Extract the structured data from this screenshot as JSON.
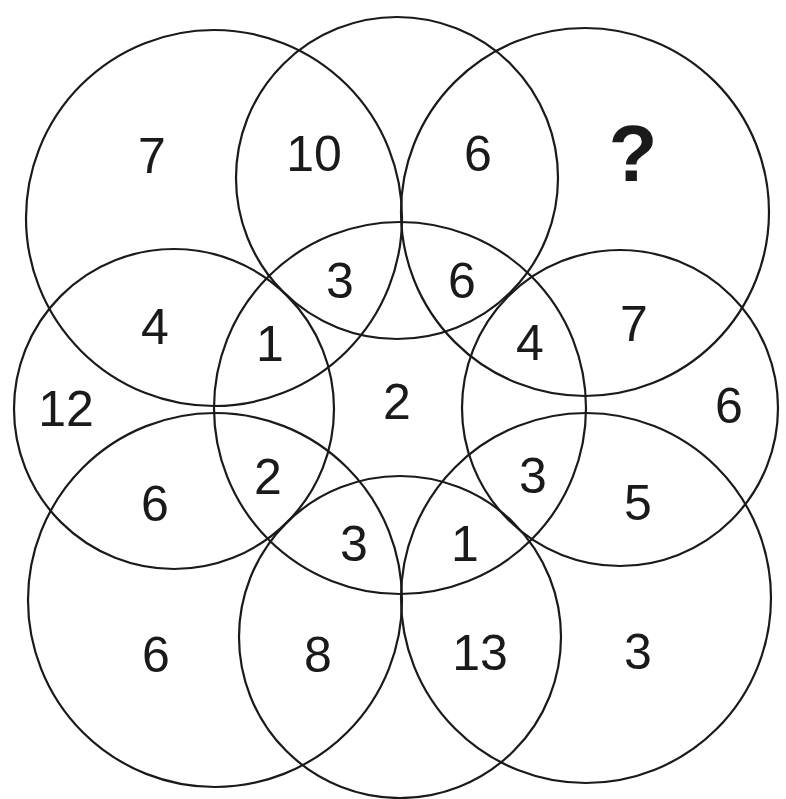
{
  "puzzle": {
    "circles": [
      {
        "id": "top-left",
        "cx": 214,
        "cy": 218,
        "r": 188
      },
      {
        "id": "top-middle",
        "cx": 397,
        "cy": 178,
        "r": 161
      },
      {
        "id": "top-right",
        "cx": 585,
        "cy": 212,
        "r": 184
      },
      {
        "id": "middle-left",
        "cx": 174,
        "cy": 409,
        "r": 160
      },
      {
        "id": "center",
        "cx": 400,
        "cy": 408,
        "r": 186
      },
      {
        "id": "middle-right",
        "cx": 620,
        "cy": 408,
        "r": 158
      },
      {
        "id": "bottom-left",
        "cx": 215,
        "cy": 600,
        "r": 187
      },
      {
        "id": "bottom-middle",
        "cx": 400,
        "cy": 637,
        "r": 161
      },
      {
        "id": "bottom-right",
        "cx": 586,
        "cy": 598,
        "r": 185
      }
    ],
    "labels": [
      {
        "text": "7",
        "x": 152,
        "y": 156
      },
      {
        "text": "10",
        "x": 314,
        "y": 154
      },
      {
        "text": "6",
        "x": 478,
        "y": 154
      },
      {
        "text": "?",
        "x": 633,
        "y": 153,
        "question": true
      },
      {
        "text": "3",
        "x": 340,
        "y": 281
      },
      {
        "text": "6",
        "x": 462,
        "y": 281
      },
      {
        "text": "4",
        "x": 155,
        "y": 327
      },
      {
        "text": "1",
        "x": 270,
        "y": 344
      },
      {
        "text": "4",
        "x": 530,
        "y": 343
      },
      {
        "text": "7",
        "x": 634,
        "y": 324
      },
      {
        "text": "12",
        "x": 66,
        "y": 409
      },
      {
        "text": "2",
        "x": 397,
        "y": 402
      },
      {
        "text": "6",
        "x": 729,
        "y": 406
      },
      {
        "text": "2",
        "x": 268,
        "y": 477
      },
      {
        "text": "3",
        "x": 533,
        "y": 476
      },
      {
        "text": "6",
        "x": 155,
        "y": 504
      },
      {
        "text": "5",
        "x": 638,
        "y": 503
      },
      {
        "text": "3",
        "x": 354,
        "y": 544
      },
      {
        "text": "1",
        "x": 465,
        "y": 544
      },
      {
        "text": "6",
        "x": 156,
        "y": 655
      },
      {
        "text": "8",
        "x": 318,
        "y": 655
      },
      {
        "text": "13",
        "x": 480,
        "y": 653
      },
      {
        "text": "3",
        "x": 638,
        "y": 652
      }
    ]
  }
}
